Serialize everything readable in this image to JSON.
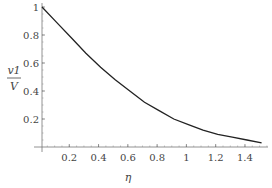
{
  "chart_data": {
    "type": "line",
    "title": "",
    "xlabel": "η",
    "ylabel_numerator": "v1",
    "ylabel_denominator": "V",
    "ylabel": "v1/V",
    "xlim": [
      0,
      1.5
    ],
    "ylim": [
      0,
      1
    ],
    "grid": false,
    "legend": null,
    "x_ticks": [
      0.2,
      0.4,
      0.6,
      0.8,
      1,
      1.2,
      1.4
    ],
    "x_tick_labels": [
      "0.2",
      "0.4",
      "0.6",
      "0.8",
      "1",
      "1.2",
      "1.4"
    ],
    "y_ticks": [
      0.2,
      0.4,
      0.6,
      0.8,
      1
    ],
    "y_tick_labels": [
      "0.2",
      "0.4",
      "0.6",
      "0.8",
      "1"
    ],
    "series": [
      {
        "name": "v1/V",
        "color": "#222222",
        "x": [
          0,
          0.1,
          0.2,
          0.3,
          0.4,
          0.5,
          0.6,
          0.7,
          0.8,
          0.9,
          1.0,
          1.1,
          1.2,
          1.3,
          1.4,
          1.5
        ],
        "y": [
          1.0,
          0.89,
          0.78,
          0.67,
          0.57,
          0.48,
          0.4,
          0.32,
          0.26,
          0.2,
          0.16,
          0.12,
          0.09,
          0.07,
          0.05,
          0.03
        ]
      }
    ]
  }
}
